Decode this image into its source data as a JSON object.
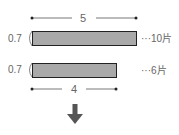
{
  "diagram": {
    "top_dimension": "5",
    "bar1": {
      "height_label": "0.7",
      "count_label": "···10片"
    },
    "bar2": {
      "height_label": "0.7",
      "count_label": "···6片"
    },
    "bottom_dimension": "4",
    "arrow": "down-arrow"
  },
  "colors": {
    "bar_fill": "#a9a9a9",
    "bar_border": "#222222",
    "line": "#444444",
    "arrow": "#555555"
  }
}
